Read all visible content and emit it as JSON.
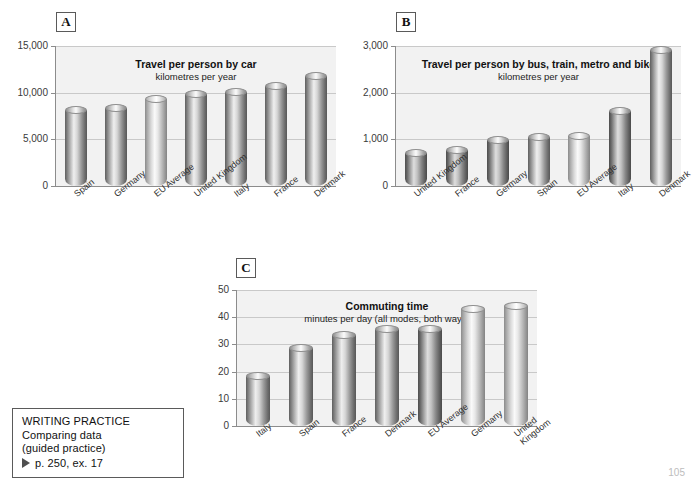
{
  "page": {
    "number": "105",
    "background": "#ffffff"
  },
  "panels": {
    "a_letter": "A",
    "b_letter": "B",
    "c_letter": "C"
  },
  "writing_practice": {
    "heading": "WRITING PRACTICE",
    "line1": "Comparing data",
    "line2": "(guided practice)",
    "reference": "p. 250, ex. 17",
    "bullet_icon": "triangle-right-icon"
  },
  "chart_data": [
    {
      "id": "A",
      "type": "bar",
      "title": "Travel per person by car",
      "subtitle": "kilometres per year",
      "xlabel": "",
      "ylabel": "",
      "ylim": [
        0,
        15000
      ],
      "yticks": [
        0,
        5000,
        10000,
        15000
      ],
      "ytick_labels": [
        "0",
        "5,000",
        "10,000",
        "15,000"
      ],
      "grid": true,
      "legend": "none",
      "categories": [
        "Spain",
        "Germany",
        "EU Average",
        "United Kingdom",
        "Italy",
        "France",
        "Denmark"
      ],
      "values": [
        8600,
        8800,
        9800,
        10300,
        10500,
        11100,
        12200
      ],
      "bar_shades": [
        "normal",
        "normal",
        "light",
        "normal",
        "normal",
        "normal",
        "normal"
      ]
    },
    {
      "id": "B",
      "type": "bar",
      "title": "Travel per person by bus, train, metro and bike",
      "subtitle": "kilometres per year",
      "xlabel": "",
      "ylabel": "",
      "ylim": [
        0,
        3000
      ],
      "yticks": [
        0,
        1000,
        2000,
        3000
      ],
      "ytick_labels": [
        "0",
        "1,000",
        "2,000",
        "3,000"
      ],
      "grid": true,
      "legend": "none",
      "categories": [
        "United Kingdom",
        "France",
        "Germany",
        "Spain",
        "EU Average",
        "Italy",
        "Denmark"
      ],
      "values": [
        800,
        850,
        1080,
        1130,
        1150,
        1700,
        3000
      ],
      "bar_shades": [
        "dark",
        "dark",
        "dark",
        "normal",
        "light",
        "dark",
        "normal"
      ]
    },
    {
      "id": "C",
      "type": "bar",
      "title": "Commuting time",
      "subtitle": "minutes per day (all modes, both ways)",
      "xlabel": "",
      "ylabel": "",
      "ylim": [
        0,
        50
      ],
      "yticks": [
        0,
        10,
        20,
        30,
        40,
        50
      ],
      "ytick_labels": [
        "0",
        "10",
        "20",
        "30",
        "40",
        "50"
      ],
      "grid": true,
      "legend": "none",
      "categories": [
        "Italy",
        "Spain",
        "France",
        "Denmark",
        "EU Average",
        "Germany",
        "United Kingdom"
      ],
      "values": [
        20,
        30,
        35,
        37,
        37,
        44.5,
        45.5
      ],
      "bar_shades": [
        "normal",
        "normal",
        "normal",
        "normal",
        "dark",
        "light",
        "light"
      ]
    }
  ]
}
